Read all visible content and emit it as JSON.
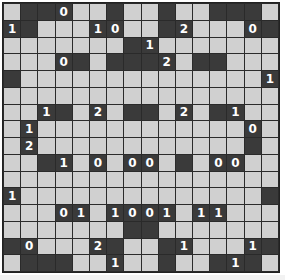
{
  "puzzle": {
    "type": "light-up",
    "rows": 16,
    "cols": 16,
    "legend": {
      "L": "empty white cell",
      "D": "black wall cell",
      "digit": "black numbered wall cell"
    },
    "grid": [
      [
        "L",
        "D",
        "D",
        "0",
        "L",
        "L",
        "D",
        "L",
        "L",
        "D",
        "L",
        "L",
        "D",
        "D",
        "D",
        "L"
      ],
      [
        "1",
        "D",
        "L",
        "L",
        "L",
        "1",
        "0",
        "L",
        "L",
        "D",
        "2",
        "L",
        "L",
        "L",
        "0",
        "D"
      ],
      [
        "L",
        "L",
        "L",
        "L",
        "L",
        "L",
        "L",
        "D",
        "1",
        "L",
        "L",
        "L",
        "L",
        "L",
        "L",
        "L"
      ],
      [
        "L",
        "L",
        "L",
        "0",
        "D",
        "L",
        "D",
        "D",
        "D",
        "2",
        "L",
        "D",
        "D",
        "L",
        "L",
        "L"
      ],
      [
        "D",
        "L",
        "L",
        "L",
        "L",
        "L",
        "L",
        "L",
        "L",
        "L",
        "L",
        "L",
        "L",
        "L",
        "L",
        "1"
      ],
      [
        "L",
        "L",
        "L",
        "L",
        "L",
        "L",
        "L",
        "L",
        "L",
        "L",
        "L",
        "L",
        "L",
        "L",
        "L",
        "L"
      ],
      [
        "L",
        "L",
        "1",
        "D",
        "L",
        "2",
        "L",
        "D",
        "D",
        "L",
        "2",
        "L",
        "D",
        "1",
        "L",
        "L"
      ],
      [
        "L",
        "1",
        "L",
        "L",
        "L",
        "L",
        "L",
        "L",
        "L",
        "L",
        "L",
        "L",
        "L",
        "L",
        "0",
        "L"
      ],
      [
        "L",
        "2",
        "L",
        "L",
        "L",
        "L",
        "L",
        "L",
        "L",
        "L",
        "L",
        "L",
        "L",
        "L",
        "D",
        "L"
      ],
      [
        "L",
        "L",
        "D",
        "1",
        "L",
        "0",
        "L",
        "0",
        "0",
        "L",
        "D",
        "L",
        "0",
        "0",
        "L",
        "L"
      ],
      [
        "L",
        "L",
        "L",
        "L",
        "L",
        "L",
        "L",
        "L",
        "L",
        "L",
        "L",
        "L",
        "L",
        "L",
        "L",
        "L"
      ],
      [
        "1",
        "L",
        "L",
        "L",
        "L",
        "L",
        "L",
        "L",
        "L",
        "L",
        "L",
        "L",
        "L",
        "L",
        "L",
        "D"
      ],
      [
        "L",
        "L",
        "L",
        "0",
        "1",
        "L",
        "1",
        "0",
        "0",
        "1",
        "L",
        "1",
        "1",
        "L",
        "L",
        "L"
      ],
      [
        "L",
        "L",
        "L",
        "L",
        "L",
        "L",
        "L",
        "D",
        "D",
        "L",
        "L",
        "L",
        "L",
        "L",
        "L",
        "L"
      ],
      [
        "D",
        "0",
        "L",
        "L",
        "L",
        "2",
        "D",
        "L",
        "L",
        "D",
        "1",
        "L",
        "L",
        "L",
        "1",
        "D"
      ],
      [
        "L",
        "D",
        "D",
        "D",
        "L",
        "L",
        "1",
        "L",
        "L",
        "D",
        "L",
        "L",
        "D",
        "1",
        "D",
        "L"
      ]
    ]
  },
  "colors": {
    "empty": "#d0d0d0",
    "wall": "#3a3a3a",
    "number": "#ffffff",
    "gridline": "#2a2a2a"
  }
}
